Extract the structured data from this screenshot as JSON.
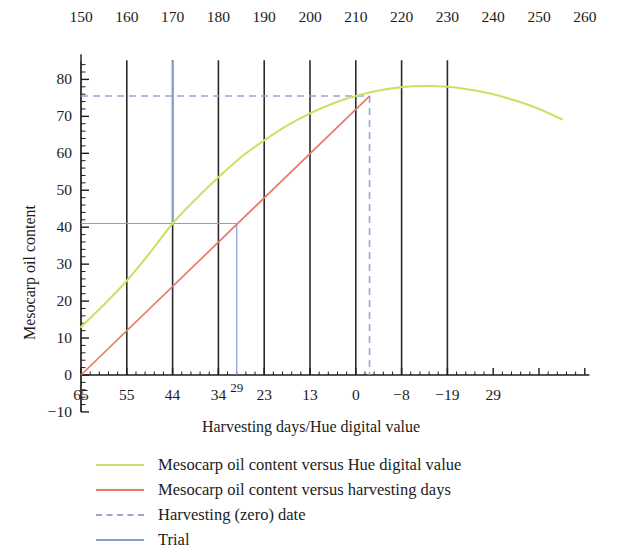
{
  "chart_data": {
    "type": "line",
    "title": "",
    "xlabel": "Harvesting days/Hue digital value",
    "ylabel": "Mesocarp oil content",
    "grid": false,
    "legend_position": "bottom-left",
    "top_axis": {
      "name": "Hue digital value",
      "ticks": [
        150,
        160,
        170,
        180,
        190,
        200,
        210,
        220,
        230,
        240,
        250,
        260
      ],
      "labels": [
        "150",
        "160",
        "170",
        "180",
        "190",
        "200",
        "210",
        "220",
        "230",
        "240",
        "250",
        "260"
      ],
      "range": [
        150,
        260
      ]
    },
    "bottom_axis": {
      "name": "Harvesting days",
      "labels": [
        "65",
        "55",
        "44",
        "34",
        "29",
        "23",
        "13",
        "0",
        "-8",
        "-19",
        "29"
      ],
      "superscript_labels": [
        "29"
      ],
      "hue_positions": [
        150,
        160,
        170,
        180,
        184,
        190,
        200,
        210,
        220,
        230,
        240
      ]
    },
    "y_axis": {
      "ticks": [
        -10,
        0,
        10,
        20,
        30,
        40,
        50,
        60,
        70,
        80
      ],
      "tick_labels": [
        "-10",
        "0",
        "10",
        "20",
        "30",
        "40",
        "50",
        "60",
        "70",
        "80"
      ],
      "range": [
        -10,
        85
      ],
      "minor_tick_step": 2
    },
    "vertical_reference_lines": {
      "color": "#2a2a2a",
      "at_hue": [
        160,
        170,
        180,
        190,
        200,
        210,
        220,
        230
      ]
    },
    "series": [
      {
        "name": "Mesocarp oil content versus Hue digital value",
        "color": "#c9e265",
        "style": "solid",
        "x_axis": "hue",
        "points": [
          {
            "x": 150,
            "y": 13.0
          },
          {
            "x": 155,
            "y": 19.0
          },
          {
            "x": 160,
            "y": 25.5
          },
          {
            "x": 165,
            "y": 33.0
          },
          {
            "x": 170,
            "y": 41.0
          },
          {
            "x": 175,
            "y": 47.5
          },
          {
            "x": 180,
            "y": 53.5
          },
          {
            "x": 185,
            "y": 59.0
          },
          {
            "x": 190,
            "y": 63.5
          },
          {
            "x": 195,
            "y": 67.5
          },
          {
            "x": 200,
            "y": 70.8
          },
          {
            "x": 205,
            "y": 73.5
          },
          {
            "x": 210,
            "y": 75.5
          },
          {
            "x": 215,
            "y": 77.0
          },
          {
            "x": 220,
            "y": 77.9
          },
          {
            "x": 225,
            "y": 78.2
          },
          {
            "x": 230,
            "y": 78.0
          },
          {
            "x": 235,
            "y": 77.2
          },
          {
            "x": 240,
            "y": 76.0
          },
          {
            "x": 245,
            "y": 74.2
          },
          {
            "x": 250,
            "y": 72.0
          },
          {
            "x": 255,
            "y": 69.2
          }
        ]
      },
      {
        "name": "Mesocarp oil content versus harvesting days",
        "color": "#e8796a",
        "style": "solid",
        "x_axis": "harvesting_days",
        "points": [
          {
            "x": 150,
            "y": 0.0
          },
          {
            "x": 213,
            "y": 75.5
          }
        ]
      },
      {
        "name": "Harvesting (zero) date",
        "color": "#9aa4d8",
        "style": "dashed",
        "horizontal_at_y": 75.5,
        "horizontal_from_x": 150,
        "horizontal_to_x": 213,
        "vertical_at_x": 213,
        "vertical_from_y": 0,
        "vertical_to_y": 75.5
      },
      {
        "name": "Trial",
        "color": "#8d9bd1",
        "style": "solid",
        "horizontal_at_y": 41.0,
        "horizontal_from_x": 150,
        "horizontal_to_x": 184,
        "vertical_at_x": 170,
        "vertical_from_y": 41.0,
        "vertical_to_y": 85,
        "drop_at_x": 184,
        "drop_from_y": 41.0,
        "drop_to_y": 0
      }
    ],
    "annotations": []
  },
  "legend": {
    "entries": [
      {
        "label": "Mesocarp oil content versus Hue digital value",
        "color": "#c9e265",
        "style": "solid"
      },
      {
        "label": "Mesocarp oil content versus harvesting days",
        "color": "#e8796a",
        "style": "solid"
      },
      {
        "label": "Harvesting (zero) date",
        "color": "#9aa4d8",
        "style": "dashed"
      },
      {
        "label": "Trial",
        "color": "#8d9bd1",
        "style": "solid"
      }
    ]
  },
  "axes": {
    "x_title": "Harvesting days/Hue digital value",
    "y_title": "Mesocarp oil content",
    "top_tick_labels": [
      "150",
      "160",
      "170",
      "180",
      "190",
      "200",
      "210",
      "220",
      "230",
      "240",
      "250",
      "260"
    ],
    "left_tick_labels": [
      "80",
      "70",
      "60",
      "50",
      "40",
      "30",
      "20",
      "10",
      "0",
      "-10"
    ],
    "bottom_tick_labels": [
      "65",
      "55",
      "44",
      "34",
      "29",
      "23",
      "13",
      "0",
      "-8",
      "-19",
      "29"
    ]
  }
}
